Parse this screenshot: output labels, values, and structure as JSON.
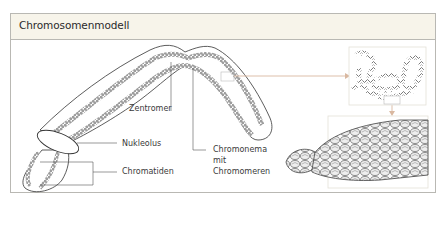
{
  "figure": {
    "title": "Chromosomenmodell",
    "labels": {
      "centromere": "Zentromer",
      "nucleolus": "Nukleolus",
      "chromatids": "Chromatiden",
      "chromonema_line1": "Chromonema",
      "chromonema_line2": "mit",
      "chromonema_line3": "Chromomeren"
    },
    "colors": {
      "header_bg": "#f7f4ea",
      "border": "#b9b8b3",
      "arrow": "#d9b8a0",
      "ink": "#333333"
    },
    "insets": [
      {
        "name": "chromonema-coil-detail"
      },
      {
        "name": "nucleosome-fiber-detail"
      }
    ]
  }
}
